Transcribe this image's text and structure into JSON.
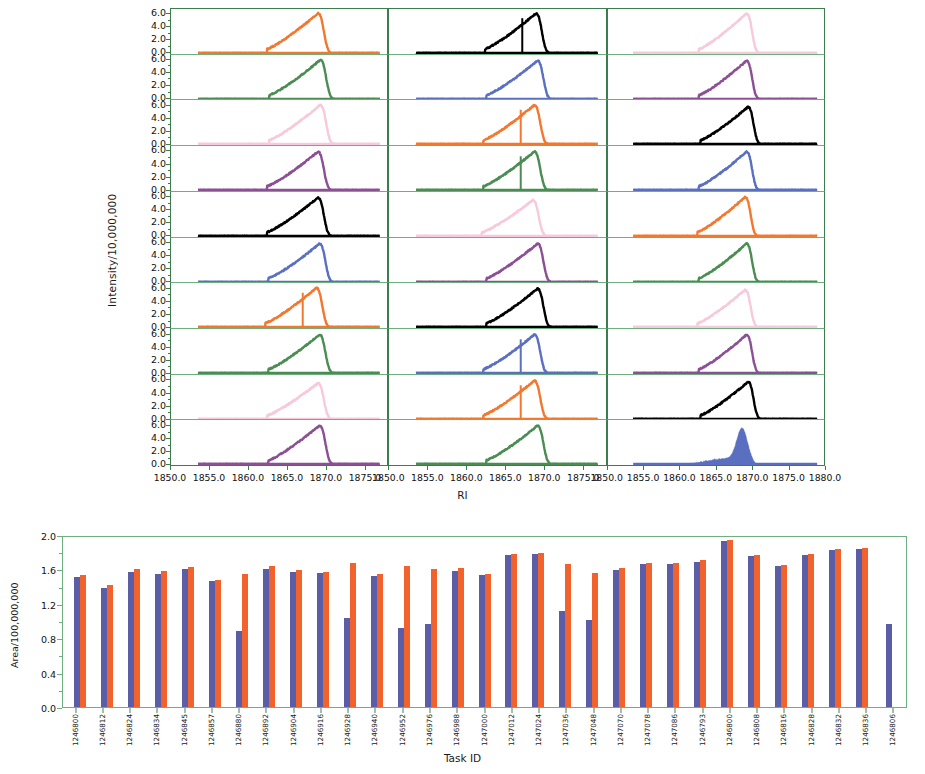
{
  "chart_data": [
    {
      "type": "line",
      "title": "",
      "xlabel": "RI",
      "ylabel": "Intensity/10,000,000",
      "grid": false,
      "legend": "none",
      "layout": {
        "columns": 3,
        "rows": 10,
        "note": "small-multiples grid of chromatogram traces"
      },
      "xlim_columns": [
        [
          1850.0,
          1878.0
        ],
        [
          1850.0,
          1878.0
        ],
        [
          1850.0,
          1880.0
        ]
      ],
      "xticks_left": [
        "1850.0",
        "1855.0",
        "1860.0",
        "1865.0",
        "1870.0",
        "1875.0"
      ],
      "xticks_middle": [
        "1850.0",
        "1855.0",
        "1860.0",
        "1865.0",
        "1870.0",
        "1875.0"
      ],
      "xticks_right": [
        "1850.0",
        "1855.0",
        "1860.0",
        "1865.0",
        "1870.0",
        "1875.0",
        "1880.0"
      ],
      "ylim": [
        0.0,
        7.0
      ],
      "yticks": [
        "0.0",
        "2.0",
        "4.0",
        "6.0"
      ],
      "series_colors": {
        "orange": "#f2772f",
        "green": "#4a8c52",
        "pink": "#f7c9da",
        "purple": "#8b4f94",
        "black": "#000000",
        "blue": "#5b6fc0"
      },
      "color_cycle": [
        "orange",
        "green",
        "pink",
        "purple",
        "black",
        "blue"
      ],
      "panels": [
        {
          "column": 1,
          "row": 1,
          "color": "orange",
          "peak_center": 1869.0,
          "peak_height": 6.2,
          "shape": "broad-shoulder",
          "spike": false
        },
        {
          "column": 1,
          "row": 2,
          "color": "green",
          "peak_center": 1869.3,
          "peak_height": 6.1,
          "shape": "broad-shoulder",
          "spike": false
        },
        {
          "column": 1,
          "row": 3,
          "color": "pink",
          "peak_center": 1869.3,
          "peak_height": 6.1,
          "shape": "broad-shoulder",
          "spike": false
        },
        {
          "column": 1,
          "row": 4,
          "color": "purple",
          "peak_center": 1869.0,
          "peak_height": 6.0,
          "shape": "broad-shoulder",
          "spike": false
        },
        {
          "column": 1,
          "row": 5,
          "color": "black",
          "peak_center": 1869.0,
          "peak_height": 6.0,
          "shape": "broad-shoulder",
          "spike": false
        },
        {
          "column": 1,
          "row": 6,
          "color": "blue",
          "peak_center": 1869.2,
          "peak_height": 6.0,
          "shape": "broad-shoulder",
          "spike": false
        },
        {
          "column": 1,
          "row": 7,
          "color": "orange",
          "peak_center": 1868.8,
          "peak_height": 6.1,
          "shape": "split",
          "spike": true
        },
        {
          "column": 1,
          "row": 8,
          "color": "green",
          "peak_center": 1869.2,
          "peak_height": 6.0,
          "shape": "broad-shoulder",
          "spike": false
        },
        {
          "column": 1,
          "row": 9,
          "color": "pink",
          "peak_center": 1869.0,
          "peak_height": 5.6,
          "shape": "broad-shoulder",
          "spike": false
        },
        {
          "column": 1,
          "row": 10,
          "color": "purple",
          "peak_center": 1869.2,
          "peak_height": 6.0,
          "shape": "broad-shoulder",
          "spike": false
        },
        {
          "column": 2,
          "row": 1,
          "color": "black",
          "peak_center": 1869.0,
          "peak_height": 6.2,
          "shape": "split",
          "spike": true
        },
        {
          "column": 2,
          "row": 2,
          "color": "blue",
          "peak_center": 1869.2,
          "peak_height": 6.0,
          "shape": "broad-shoulder",
          "spike": false
        },
        {
          "column": 2,
          "row": 3,
          "color": "orange",
          "peak_center": 1868.8,
          "peak_height": 6.1,
          "shape": "split",
          "spike": true
        },
        {
          "column": 2,
          "row": 4,
          "color": "green",
          "peak_center": 1868.8,
          "peak_height": 6.0,
          "shape": "split",
          "spike": true
        },
        {
          "column": 2,
          "row": 5,
          "color": "pink",
          "peak_center": 1868.6,
          "peak_height": 5.6,
          "shape": "broad-shoulder",
          "spike": false
        },
        {
          "column": 2,
          "row": 6,
          "color": "purple",
          "peak_center": 1869.2,
          "peak_height": 6.0,
          "shape": "broad-shoulder",
          "spike": false
        },
        {
          "column": 2,
          "row": 7,
          "color": "black",
          "peak_center": 1869.2,
          "peak_height": 6.0,
          "shape": "broad-shoulder",
          "spike": false
        },
        {
          "column": 2,
          "row": 8,
          "color": "blue",
          "peak_center": 1868.8,
          "peak_height": 6.0,
          "shape": "split",
          "spike": true
        },
        {
          "column": 2,
          "row": 9,
          "color": "orange",
          "peak_center": 1868.8,
          "peak_height": 6.0,
          "shape": "split",
          "spike": true
        },
        {
          "column": 2,
          "row": 10,
          "color": "green",
          "peak_center": 1869.2,
          "peak_height": 6.0,
          "shape": "broad-shoulder",
          "spike": false
        },
        {
          "column": 3,
          "row": 1,
          "color": "pink",
          "peak_center": 1869.2,
          "peak_height": 6.2,
          "shape": "broad-shoulder",
          "spike": false
        },
        {
          "column": 3,
          "row": 2,
          "color": "purple",
          "peak_center": 1869.2,
          "peak_height": 6.0,
          "shape": "broad-shoulder",
          "spike": false
        },
        {
          "column": 3,
          "row": 3,
          "color": "black",
          "peak_center": 1869.4,
          "peak_height": 5.8,
          "shape": "broad-shoulder",
          "spike": false
        },
        {
          "column": 3,
          "row": 4,
          "color": "blue",
          "peak_center": 1869.2,
          "peak_height": 6.0,
          "shape": "broad-shoulder",
          "spike": false
        },
        {
          "column": 3,
          "row": 5,
          "color": "orange",
          "peak_center": 1869.0,
          "peak_height": 6.1,
          "shape": "broad-shoulder",
          "spike": false
        },
        {
          "column": 3,
          "row": 6,
          "color": "green",
          "peak_center": 1869.2,
          "peak_height": 6.0,
          "shape": "broad-shoulder",
          "spike": false
        },
        {
          "column": 3,
          "row": 7,
          "color": "pink",
          "peak_center": 1869.0,
          "peak_height": 5.8,
          "shape": "broad-shoulder",
          "spike": false
        },
        {
          "column": 3,
          "row": 8,
          "color": "purple",
          "peak_center": 1869.2,
          "peak_height": 6.0,
          "shape": "broad-shoulder",
          "spike": false
        },
        {
          "column": 3,
          "row": 9,
          "color": "black",
          "peak_center": 1869.4,
          "peak_height": 5.8,
          "shape": "broad-shoulder",
          "spike": false
        },
        {
          "column": 3,
          "row": 10,
          "color": "blue",
          "peak_center": 1868.6,
          "peak_height": 5.4,
          "shape": "narrow-filled",
          "spike": false
        }
      ]
    },
    {
      "type": "bar",
      "title": "",
      "xlabel": "Task ID",
      "ylabel": "Area/100,000,000",
      "grid": false,
      "legend": "none",
      "ylim": [
        0.0,
        2.0
      ],
      "yticks": [
        "0.0",
        "0.4",
        "0.8",
        "1.2",
        "1.6",
        "2.0"
      ],
      "series": [
        {
          "name": "blue",
          "color": "#5b5ea6",
          "values": [
            1.53,
            1.4,
            1.59,
            1.57,
            1.62,
            1.48,
            0.89,
            1.62,
            1.59,
            1.58,
            1.05,
            1.54,
            0.93,
            0.98,
            1.6,
            1.55,
            1.79,
            1.8,
            1.13,
            1.02,
            1.61,
            1.68,
            1.68,
            1.71,
            1.95,
            1.78,
            1.66,
            1.79,
            1.85,
            1.86,
            0.98
          ]
        },
        {
          "name": "orange",
          "color": "#f2622c",
          "values": [
            1.55,
            1.43,
            1.62,
            1.6,
            1.65,
            1.49,
            1.57,
            1.66,
            1.61,
            1.59,
            1.7,
            1.56,
            1.66,
            1.62,
            1.64,
            1.57,
            1.8,
            1.81,
            1.68,
            1.58,
            1.63,
            1.69,
            1.7,
            1.73,
            1.96,
            1.79,
            1.67,
            1.8,
            1.86,
            1.87,
            null
          ]
        }
      ],
      "categories": [
        "1246800",
        "1246812",
        "1246824",
        "1246834",
        "1246845",
        "1246857",
        "1246880",
        "1246892",
        "1246904",
        "1246916",
        "1246928",
        "1246940",
        "1246952",
        "1246976",
        "1246988",
        "1247000",
        "1247012",
        "1247024",
        "1247036",
        "1247048",
        "1247070",
        "1247078",
        "1247086",
        "1246793",
        "1246800",
        "1246808",
        "1246816",
        "1246828",
        "1246832",
        "1246836",
        "1246806"
      ]
    }
  ],
  "axes": {
    "top": {
      "ylabel": "Intensity/10,000,000",
      "xlabel": "RI",
      "yticks": [
        "6.0",
        "4.0",
        "2.0",
        "0.0"
      ],
      "xticks_left": [
        "1850.0",
        "1855.0",
        "1860.0",
        "1865.0",
        "1870.0",
        "1875.0"
      ],
      "xticks_middle": [
        "1850.0",
        "1855.0",
        "1860.0",
        "1865.0",
        "1870.0",
        "1875.0"
      ],
      "xticks_right": [
        "1850.0",
        "1855.0",
        "1860.0",
        "1865.0",
        "1870.0",
        "1875.0",
        "1880.0"
      ]
    },
    "bottom": {
      "ylabel": "Area/100,000,000",
      "xlabel": "Task ID",
      "yticks": [
        "2.0",
        "1.6",
        "1.2",
        "0.8",
        "0.4",
        "0.0"
      ]
    }
  },
  "colors": {
    "axis_green": "#3c7d4f",
    "axis_green_light": "#6fae81",
    "bar_blue": "#5b5ea6",
    "bar_orange": "#f2622c",
    "trace_orange": "#f2772f",
    "trace_green": "#4a8c52",
    "trace_pink": "#f7c9da",
    "trace_purple": "#8b4f94",
    "trace_black": "#000000",
    "trace_blue": "#5b6fc0"
  }
}
